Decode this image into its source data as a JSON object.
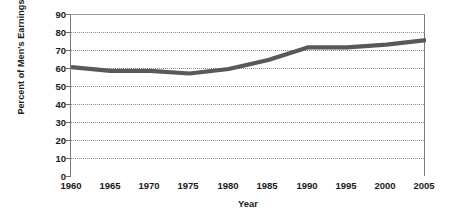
{
  "chart_data": {
    "type": "line",
    "title": "",
    "xlabel": "Year",
    "ylabel": "Percent of Men's Earnings",
    "xlim": [
      1960,
      2005
    ],
    "ylim": [
      0,
      90
    ],
    "grid": true,
    "legend": false,
    "legend_position": "none",
    "line_color": "#595959",
    "x_ticks": [
      "1960",
      "1965",
      "1970",
      "1975",
      "1980",
      "1985",
      "1990",
      "1995",
      "2000",
      "2005"
    ],
    "y_ticks": [
      "0",
      "10",
      "20",
      "30",
      "40",
      "50",
      "60",
      "70",
      "80",
      "90"
    ],
    "x": [
      1960,
      1965,
      1970,
      1975,
      1980,
      1985,
      1990,
      1995,
      2000,
      2005
    ],
    "series": [
      {
        "name": "Percent of Men's Earnings",
        "values": [
          61,
          59,
          59,
          57.5,
          60,
          65,
          72,
          72,
          73.5,
          76
        ]
      }
    ]
  }
}
